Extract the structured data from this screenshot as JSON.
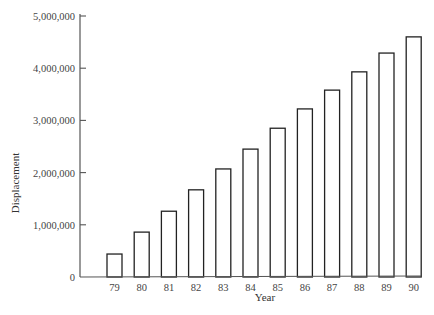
{
  "chart_data": {
    "type": "bar",
    "title": "",
    "xlabel": "Year",
    "ylabel": "Displacement",
    "categories": [
      "79",
      "80",
      "81",
      "82",
      "83",
      "84",
      "85",
      "86",
      "87",
      "88",
      "89",
      "90"
    ],
    "values": [
      440000,
      860000,
      1260000,
      1670000,
      2070000,
      2450000,
      2850000,
      3220000,
      3580000,
      3930000,
      4290000,
      4600000
    ],
    "ylim": [
      0,
      5000000
    ],
    "yticks": [
      0,
      1000000,
      2000000,
      3000000,
      4000000,
      5000000
    ],
    "ytick_labels": [
      "0",
      "1,000,000",
      "2,000,000",
      "3,000,000",
      "4,000,000",
      "5,000,000"
    ],
    "grid": false,
    "legend": null,
    "bar_style": {
      "fill": "#ffffff",
      "stroke": "#222222"
    }
  }
}
